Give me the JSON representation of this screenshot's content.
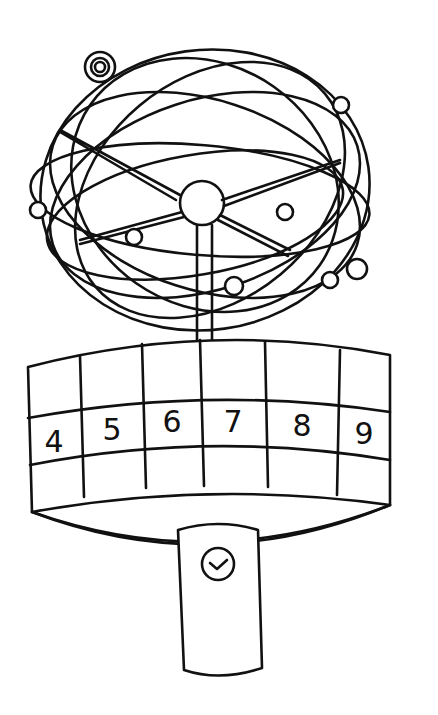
{
  "illustration": {
    "subject": "orrery / planetary model on a calendar drum with clock pedestal",
    "drum_numbers": [
      "4",
      "5",
      "6",
      "7",
      "8",
      "9"
    ],
    "pedestal_icon": "clock-check-icon",
    "colors": {
      "line": "#111111",
      "background": "#ffffff"
    }
  }
}
